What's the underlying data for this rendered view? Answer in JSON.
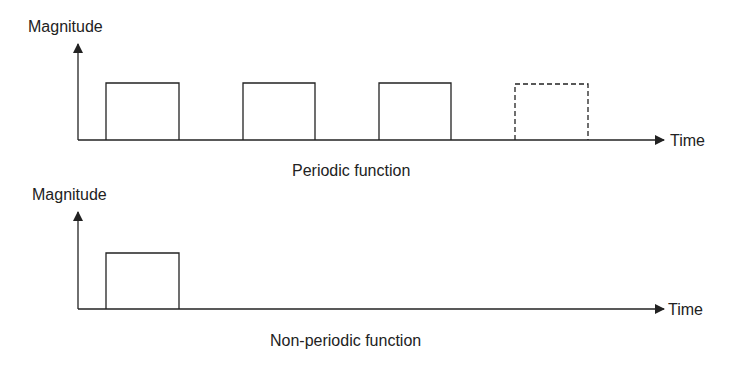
{
  "diagrams": [
    {
      "name": "periodic",
      "y_label": "Magnitude",
      "x_label": "Time",
      "caption": "Periodic function",
      "pulses": [
        {
          "x0": 106,
          "x1": 179,
          "style": "solid"
        },
        {
          "x0": 243,
          "x1": 315,
          "style": "solid"
        },
        {
          "x0": 379,
          "x1": 451,
          "style": "solid"
        },
        {
          "x0": 515,
          "x1": 588,
          "style": "dashed"
        }
      ]
    },
    {
      "name": "non-periodic",
      "y_label": "Magnitude",
      "x_label": "Time",
      "caption": "Non-periodic function",
      "pulses": [
        {
          "x0": 106,
          "x1": 179,
          "style": "solid"
        }
      ]
    }
  ],
  "colors": {
    "line": "#222222",
    "background": "#ffffff"
  }
}
